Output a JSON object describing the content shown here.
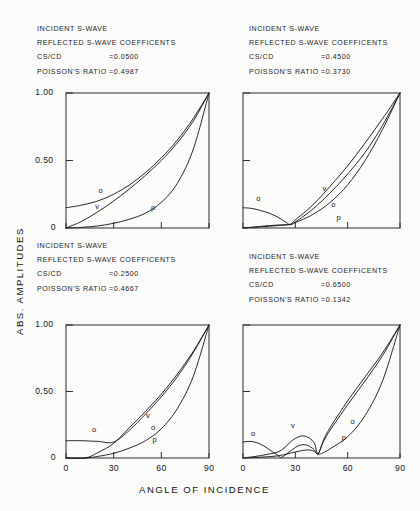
{
  "figure": {
    "x_axis_label": "ANGLE OF INCIDENCE",
    "y_axis_label": "ABS. AMPLITUDES"
  },
  "chart_data": {
    "type": "line",
    "title": "",
    "xlabel": "ANGLE OF INCIDENCE",
    "ylabel": "ABS. AMPLITUDES",
    "xlim": [
      0,
      90
    ],
    "ylim": [
      0,
      1.0
    ],
    "xticks": [
      0,
      30,
      60,
      90
    ],
    "xticklabels": [
      "0",
      "30",
      "60",
      "90"
    ],
    "yticks": [
      0,
      0.5,
      1.0
    ],
    "yticklabels": [
      "0",
      "0.50",
      "1.00"
    ],
    "grid": false,
    "legend": "inline-curve-labels",
    "panel_layout": "2x2",
    "series_names": [
      "o",
      "v",
      "p"
    ],
    "panels": [
      {
        "id": "top-left",
        "header_lines": [
          "INCIDENT S-WAVE",
          "REFLECTED S-WAVE COEFFICENTS"
        ],
        "cs_cd_label": "CS/CD",
        "cs_cd_value": "=0.0500",
        "poisson_label": "POISSON'S RATIO",
        "poisson_value": "=0.4987",
        "yticklabels_shown": [
          "1.00",
          "0.50",
          "0"
        ],
        "xticklabels_shown": [],
        "series": [
          {
            "name": "o",
            "x": [
              0,
              10,
              20,
              30,
              40,
              50,
              60,
              70,
              80,
              90
            ],
            "y": [
              0.15,
              0.17,
              0.2,
              0.25,
              0.32,
              0.41,
              0.52,
              0.65,
              0.81,
              1.0
            ]
          },
          {
            "name": "v",
            "x": [
              0,
              10,
              20,
              30,
              40,
              50,
              60,
              70,
              80,
              90
            ],
            "y": [
              0.0,
              0.05,
              0.12,
              0.2,
              0.29,
              0.39,
              0.5,
              0.63,
              0.79,
              1.0
            ]
          },
          {
            "name": "p",
            "x": [
              0,
              10,
              20,
              30,
              40,
              50,
              60,
              70,
              80,
              90
            ],
            "y": [
              0.0,
              0.005,
              0.015,
              0.035,
              0.065,
              0.11,
              0.19,
              0.33,
              0.58,
              1.0
            ]
          }
        ],
        "curve_labels": [
          {
            "text": "o",
            "x": 22,
            "y": 0.27
          },
          {
            "text": "v",
            "x": 20,
            "y": 0.15
          },
          {
            "text": "p",
            "x": 55,
            "y": 0.14
          }
        ]
      },
      {
        "id": "top-right",
        "header_lines": [
          "INCIDENT S-WAVE",
          "REFLECTED S-WAVE COEFFICENTS"
        ],
        "cs_cd_label": "CS/CD",
        "cs_cd_value": "=0.4500",
        "poisson_label": "POISSON'S RATIO",
        "poisson_value": "=0.3730",
        "yticklabels_shown": [],
        "xticklabels_shown": [],
        "series": [
          {
            "name": "o",
            "x": [
              0,
              5,
              10,
              15,
              20,
              25,
              27,
              30,
              35,
              40,
              50,
              60,
              70,
              80,
              90
            ],
            "y": [
              0.15,
              0.145,
              0.13,
              0.11,
              0.08,
              0.04,
              0.025,
              0.045,
              0.09,
              0.14,
              0.26,
              0.4,
              0.56,
              0.76,
              1.0
            ]
          },
          {
            "name": "v",
            "x": [
              0,
              10,
              20,
              27,
              30,
              40,
              50,
              60,
              70,
              80,
              90
            ],
            "y": [
              0.0,
              0.012,
              0.022,
              0.028,
              0.06,
              0.17,
              0.31,
              0.46,
              0.63,
              0.81,
              1.0
            ]
          },
          {
            "name": "p",
            "x": [
              0,
              10,
              20,
              27,
              30,
              40,
              50,
              60,
              70,
              80,
              90
            ],
            "y": [
              0.0,
              0.008,
              0.018,
              0.026,
              0.04,
              0.1,
              0.19,
              0.32,
              0.5,
              0.73,
              1.0
            ]
          }
        ],
        "curve_labels": [
          {
            "text": "o",
            "x": 9,
            "y": 0.21
          },
          {
            "text": "v",
            "x": 47,
            "y": 0.28
          },
          {
            "text": "o",
            "x": 52,
            "y": 0.16
          },
          {
            "text": "p",
            "x": 55,
            "y": 0.07
          }
        ]
      },
      {
        "id": "bottom-left",
        "header_lines": [
          "INCIDENT S-WAVE",
          "REFLECTED S-WAVE COEFFICENTS"
        ],
        "cs_cd_label": "CS/CD",
        "cs_cd_value": "=0.2500",
        "poisson_label": "POISSON'S RATIO",
        "poisson_value": "=0.4667",
        "yticklabels_shown": [
          "1.00",
          "0.50",
          "0"
        ],
        "xticklabels_shown": [
          "0",
          "30",
          "60",
          "90"
        ],
        "series": [
          {
            "name": "o",
            "x": [
              0,
              10,
              20,
              30,
              40,
              50,
              60,
              70,
              80,
              90
            ],
            "y": [
              0.13,
              0.13,
              0.125,
              0.12,
              0.21,
              0.33,
              0.46,
              0.61,
              0.79,
              1.0
            ]
          },
          {
            "name": "v",
            "x": [
              0,
              12,
              20,
              30,
              40,
              50,
              60,
              70,
              80,
              90
            ],
            "y": [
              0.0,
              0.0,
              0.04,
              0.11,
              0.23,
              0.35,
              0.48,
              0.63,
              0.8,
              1.0
            ]
          },
          {
            "name": "p",
            "x": [
              0,
              12,
              20,
              30,
              40,
              50,
              60,
              70,
              80,
              90
            ],
            "y": [
              0.0,
              0.0,
              0.012,
              0.035,
              0.075,
              0.13,
              0.22,
              0.37,
              0.61,
              1.0
            ]
          }
        ],
        "curve_labels": [
          {
            "text": "o",
            "x": 18,
            "y": 0.2
          },
          {
            "text": "v",
            "x": 52,
            "y": 0.31
          },
          {
            "text": "o",
            "x": 55,
            "y": 0.22
          },
          {
            "text": "p",
            "x": 56,
            "y": 0.13
          }
        ]
      },
      {
        "id": "bottom-right",
        "header_lines": [
          "INCIDENT S-WAVE",
          "REFLECTED S-WAVE COEFFICENTS"
        ],
        "cs_cd_label": "CS/CD",
        "cs_cd_value": "=0.6500",
        "poisson_label": "POISSON'S RATIO",
        "poisson_value": "=0.1342",
        "yticklabels_shown": [],
        "xticklabels_shown": [
          "0",
          "30",
          "60",
          "90"
        ],
        "series": [
          {
            "name": "o",
            "x": [
              0,
              4,
              8,
              12,
              16,
              20,
              22,
              26,
              30,
              34,
              38,
              41,
              43,
              46,
              50,
              60,
              70,
              80,
              90
            ],
            "y": [
              0.12,
              0.125,
              0.115,
              0.09,
              0.055,
              0.02,
              0.005,
              0.04,
              0.08,
              0.1,
              0.09,
              0.06,
              0.03,
              0.12,
              0.21,
              0.4,
              0.58,
              0.77,
              1.0
            ]
          },
          {
            "name": "v",
            "x": [
              0,
              5,
              10,
              15,
              20,
              24,
              28,
              32,
              35,
              38,
              41,
              43,
              46,
              50,
              60,
              70,
              80,
              90
            ],
            "y": [
              0.0,
              0.008,
              0.018,
              0.03,
              0.045,
              0.08,
              0.13,
              0.16,
              0.165,
              0.15,
              0.11,
              0.03,
              0.13,
              0.23,
              0.43,
              0.61,
              0.79,
              1.0
            ]
          },
          {
            "name": "p",
            "x": [
              0,
              10,
              20,
              30,
              36,
              40,
              43,
              46,
              50,
              60,
              70,
              80,
              90
            ],
            "y": [
              0.0,
              0.006,
              0.016,
              0.045,
              0.06,
              0.055,
              0.03,
              0.04,
              0.07,
              0.16,
              0.32,
              0.58,
              1.0
            ]
          }
        ],
        "curve_labels": [
          {
            "text": "o",
            "x": 6,
            "y": 0.17
          },
          {
            "text": "v",
            "x": 29,
            "y": 0.23
          },
          {
            "text": "o",
            "x": 63,
            "y": 0.26
          },
          {
            "text": "p",
            "x": 58,
            "y": 0.14
          }
        ]
      }
    ]
  }
}
